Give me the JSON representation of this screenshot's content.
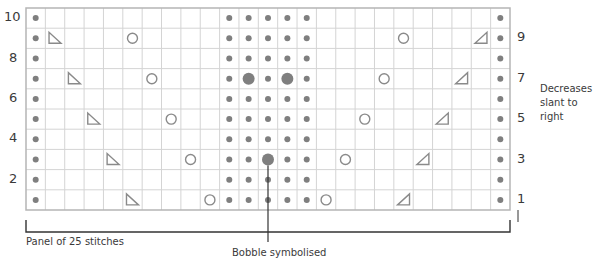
{
  "chart_title": "Knitting chart: lace and bobble panel",
  "grid": {
    "columns": 25,
    "rows": 10,
    "colors": {
      "grid_line": "#d4d4d4",
      "border": "#b5b5b5",
      "symbol": "#8a8a8a",
      "dot": "#7f7f7f",
      "bracket": "#333333"
    }
  },
  "row_labels_left": [
    "10",
    "8",
    "6",
    "4",
    "2"
  ],
  "row_labels_right": [
    "9",
    "7",
    "5",
    "3",
    "1"
  ],
  "annotations": {
    "panel": "Panel of 25 stitches",
    "bobble": "Bobble symbolised",
    "decrease_line1": "Decreases",
    "decrease_line2": "slant to right"
  },
  "legend_symbols": {
    "dot": "purl-dot-icon",
    "large_dot": "bobble-icon",
    "circle": "yarn-over-icon",
    "left_triangle": "decrease-left-icon",
    "right_triangle": "decrease-right-icon"
  },
  "chart_data": {
    "type": "table",
    "rows": [
      {
        "row": 1,
        "purl": [
          0,
          10,
          11,
          12,
          13,
          14,
          24
        ],
        "bobble": [],
        "yo": [
          9,
          15
        ],
        "dec_left": [
          5
        ],
        "dec_right": [
          19
        ]
      },
      {
        "row": 2,
        "purl": [
          0,
          10,
          11,
          12,
          13,
          14,
          24
        ],
        "bobble": [],
        "yo": [],
        "dec_left": [],
        "dec_right": []
      },
      {
        "row": 3,
        "purl": [
          0,
          10,
          11,
          13,
          14,
          24
        ],
        "bobble": [
          12
        ],
        "yo": [
          8,
          16
        ],
        "dec_left": [
          4
        ],
        "dec_right": [
          20
        ]
      },
      {
        "row": 4,
        "purl": [
          0,
          10,
          11,
          12,
          13,
          14,
          24
        ],
        "bobble": [],
        "yo": [],
        "dec_left": [],
        "dec_right": []
      },
      {
        "row": 5,
        "purl": [
          0,
          10,
          11,
          12,
          13,
          14,
          24
        ],
        "bobble": [],
        "yo": [
          7,
          17
        ],
        "dec_left": [
          3
        ],
        "dec_right": [
          21
        ]
      },
      {
        "row": 6,
        "purl": [
          0,
          10,
          11,
          12,
          13,
          14,
          24
        ],
        "bobble": [],
        "yo": [],
        "dec_left": [],
        "dec_right": []
      },
      {
        "row": 7,
        "purl": [
          0,
          10,
          12,
          14,
          24
        ],
        "bobble": [
          11,
          13
        ],
        "yo": [
          6,
          18
        ],
        "dec_left": [
          2
        ],
        "dec_right": [
          22
        ]
      },
      {
        "row": 8,
        "purl": [
          0,
          10,
          11,
          12,
          13,
          14,
          24
        ],
        "bobble": [],
        "yo": [],
        "dec_left": [],
        "dec_right": []
      },
      {
        "row": 9,
        "purl": [
          0,
          10,
          11,
          12,
          13,
          14,
          24
        ],
        "bobble": [],
        "yo": [
          5,
          19
        ],
        "dec_left": [
          1
        ],
        "dec_right": [
          23
        ]
      },
      {
        "row": 10,
        "purl": [
          0,
          10,
          11,
          12,
          13,
          14,
          24
        ],
        "bobble": [],
        "yo": [],
        "dec_left": [],
        "dec_right": []
      }
    ],
    "xlabel": "Panel of 25 stitches",
    "row_numbering": {
      "left_even": [
        2,
        4,
        6,
        8,
        10
      ],
      "right_odd": [
        1,
        3,
        5,
        7,
        9
      ]
    }
  }
}
